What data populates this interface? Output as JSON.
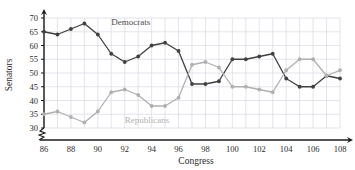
{
  "chart_data": {
    "type": "line",
    "title": "",
    "xlabel": "Congress",
    "ylabel": "Senators",
    "xlim": [
      86,
      108
    ],
    "ylim": [
      30,
      70
    ],
    "yticks": [
      30,
      35,
      40,
      45,
      50,
      55,
      60,
      65,
      70
    ],
    "xticks": [
      86,
      88,
      90,
      92,
      94,
      96,
      98,
      100,
      102,
      104,
      106,
      108
    ],
    "x": [
      86,
      87,
      88,
      89,
      90,
      91,
      92,
      93,
      94,
      95,
      96,
      97,
      98,
      99,
      100,
      101,
      102,
      103,
      104,
      105,
      106,
      107,
      108
    ],
    "grid": true,
    "axis_break": true,
    "legend_position": "inline-annotation",
    "series": [
      {
        "name": "Democrats",
        "color": "#404040",
        "values": [
          65,
          64,
          66,
          68,
          64,
          57,
          54,
          56,
          60,
          61,
          58,
          46,
          46,
          47,
          55,
          55,
          56,
          57,
          48,
          45,
          45,
          49,
          48
        ]
      },
      {
        "name": "Republicans",
        "color": "#b0b0b0",
        "values": [
          35,
          36,
          34,
          32,
          36,
          43,
          44,
          42,
          38,
          38,
          41,
          53,
          54,
          52,
          45,
          45,
          44,
          43,
          51,
          55,
          55,
          49,
          51
        ]
      }
    ],
    "annotations": [
      {
        "text": "Democrats",
        "x": 91.0,
        "y": 67.5
      },
      {
        "text": "Republicans",
        "x": 92.0,
        "y": 31.8
      }
    ]
  },
  "colors": {
    "grid": "#d8d8e2",
    "axis": "#1a1a1a",
    "democrats": "#404040",
    "republicans": "#b0b0b0",
    "background": "#ffffff"
  }
}
